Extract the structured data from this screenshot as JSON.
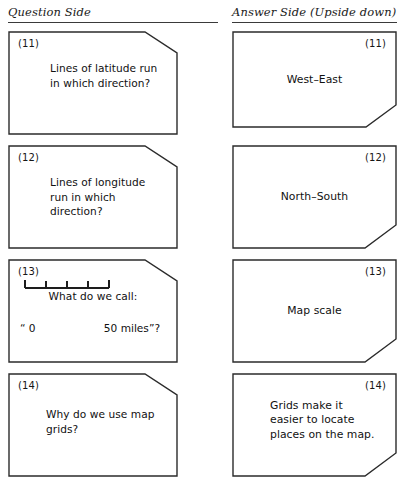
{
  "page": {
    "background_color": "#ffffff",
    "ink_color": "#2b2b2b"
  },
  "headers": {
    "question": "Question Side",
    "answer": "Answer Side (Upside down)"
  },
  "cards": [
    {
      "number": "(11)",
      "question": "Lines of latitude run in which direction?",
      "answer": "West–East"
    },
    {
      "number": "(12)",
      "question": "Lines of longitude run in which direction?",
      "answer": "North–South"
    },
    {
      "number": "(13)",
      "question": "What do we call:",
      "answer": "Map scale",
      "scale_graphic": {
        "left_label": "“ 0",
        "right_label": "50 miles”?",
        "segments": 4,
        "start_value": "0",
        "end_value": "50 miles"
      }
    },
    {
      "number": "(14)",
      "question": "Why do we use map grids?",
      "answer": "Grids make it easier to locate places on the map."
    }
  ]
}
